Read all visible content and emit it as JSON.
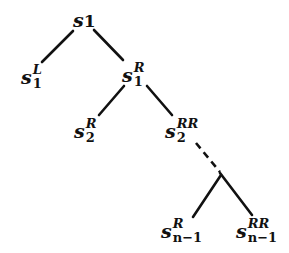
{
  "diagram": {
    "type": "binary-tree",
    "stroke_color": "#111111",
    "nodes": {
      "root": {
        "base": "s",
        "sup": "",
        "sub": "1",
        "label": "s1"
      },
      "s1L": {
        "base": "s",
        "sup": "L",
        "sub": "1",
        "label": "s1^L"
      },
      "s1R": {
        "base": "s",
        "sup": "R",
        "sub": "1",
        "label": "s1^R"
      },
      "s2R": {
        "base": "s",
        "sup": "R",
        "sub": "2",
        "label": "s2^R"
      },
      "s2RR": {
        "base": "s",
        "sup": "RR",
        "sub": "2",
        "label": "s2^RR"
      },
      "snm1R": {
        "base": "s",
        "sup": "R",
        "sub": "n−1",
        "label": "s(n-1)^R"
      },
      "snm1RR": {
        "base": "s",
        "sup": "RR",
        "sub": "n−1",
        "label": "s(n-1)^RR"
      }
    },
    "edges": [
      {
        "from": "root",
        "to": "s1L",
        "style": "solid"
      },
      {
        "from": "root",
        "to": "s1R",
        "style": "solid"
      },
      {
        "from": "s1R",
        "to": "s2R",
        "style": "solid"
      },
      {
        "from": "s1R",
        "to": "s2RR",
        "style": "solid"
      },
      {
        "from": "s2RR",
        "to": "branch",
        "style": "dashed"
      },
      {
        "from": "branch",
        "to": "snm1R",
        "style": "solid"
      },
      {
        "from": "branch",
        "to": "snm1RR",
        "style": "solid"
      }
    ]
  }
}
